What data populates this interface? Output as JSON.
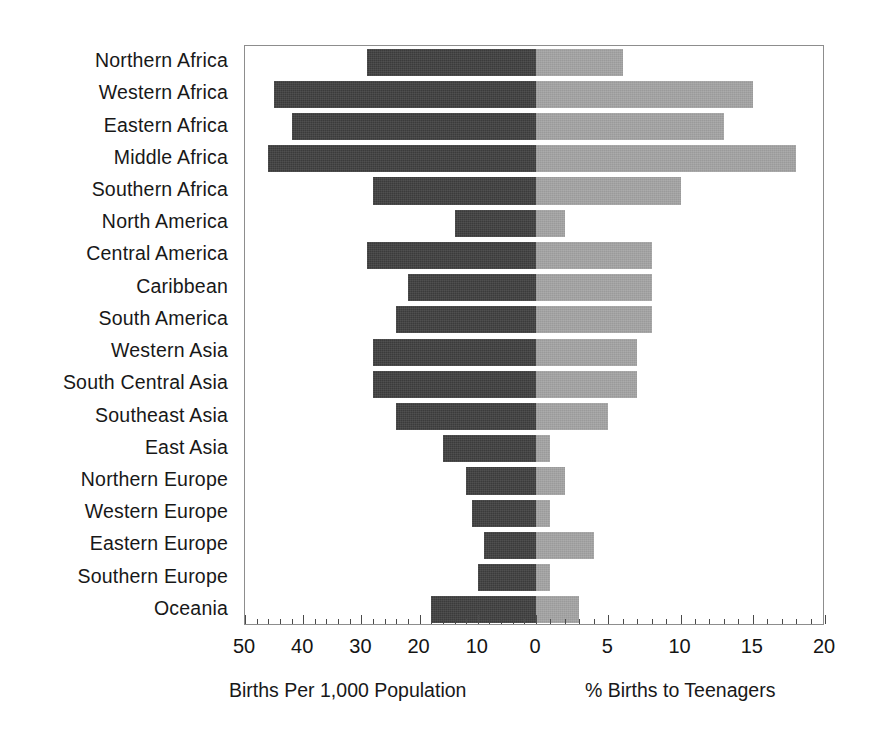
{
  "chart_data": {
    "type": "bar",
    "orientation": "horizontal",
    "layout": "population-pyramid-style back-to-back bars",
    "title": "",
    "categories": [
      "Northern Africa",
      "Western Africa",
      "Eastern Africa",
      "Middle Africa",
      "Southern Africa",
      "North America",
      "Central America",
      "Caribbean",
      "South America",
      "Western Asia",
      "South Central Asia",
      "Southeast Asia",
      "East Asia",
      "Northern Europe",
      "Western Europe",
      "Eastern Europe",
      "Southern Europe",
      "Oceania"
    ],
    "series": [
      {
        "name": "Births Per 1,000 Population",
        "side": "left",
        "color": "#3b3b3b",
        "axis_label": "Births Per 1,000 Population",
        "axis_ticks": [
          50,
          40,
          30,
          20,
          10,
          0
        ],
        "axis_range": [
          50,
          0
        ],
        "minor_tick_step": 2,
        "values": [
          29,
          45,
          42,
          46,
          28,
          14,
          29,
          22,
          24,
          28,
          28,
          24,
          16,
          12,
          11,
          9,
          10,
          18
        ]
      },
      {
        "name": "% Births to Teenagers",
        "side": "right",
        "color": "#a2a2a2",
        "axis_label": "% Births to Teenagers",
        "axis_ticks": [
          0,
          5,
          10,
          15,
          20
        ],
        "axis_range": [
          0,
          20
        ],
        "minor_tick_step": 1,
        "values": [
          6.0,
          15.0,
          13.0,
          18.0,
          10.0,
          2.0,
          8.0,
          8.0,
          8.0,
          7.0,
          7.0,
          5.0,
          1.0,
          2.0,
          1.0,
          4.0,
          1.0,
          3.0
        ]
      }
    ],
    "grid": false,
    "legend": "none",
    "frame": true
  },
  "axis": {
    "tick_labels": [
      "50",
      "40",
      "30",
      "20",
      "10",
      "0",
      "5",
      "10",
      "15",
      "20"
    ],
    "caption_left": "Births Per 1,000 Population",
    "caption_right": "% Births to Teenagers"
  },
  "colors": {
    "bar_left": "#3b3b3b",
    "bar_right": "#a2a2a2",
    "frame": "#8d8d8d",
    "text": "#181818",
    "background": "#ffffff"
  }
}
